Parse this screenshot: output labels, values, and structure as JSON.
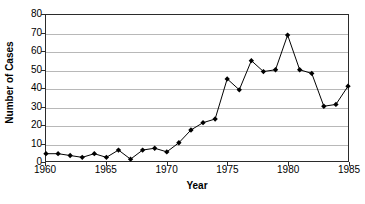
{
  "chart_data": {
    "type": "line",
    "title": "",
    "xlabel": "Year",
    "ylabel": "Number of Cases",
    "xlim": [
      1960,
      1985
    ],
    "ylim": [
      0,
      80
    ],
    "ytick_step": 10,
    "xtick_step": 5,
    "grid": true,
    "grid_axis": "y",
    "legend": false,
    "marker": "diamond",
    "line_color": "#000000",
    "marker_color": "#000000",
    "grid_color": "#b8b8b8",
    "axis_color": "#2b2b2b",
    "x": [
      1960,
      1961,
      1962,
      1963,
      1964,
      1965,
      1966,
      1967,
      1968,
      1969,
      1970,
      1971,
      1972,
      1973,
      1974,
      1975,
      1976,
      1977,
      1978,
      1979,
      1980,
      1981,
      1982,
      1983,
      1984,
      1985
    ],
    "values": [
      4,
      4,
      3,
      2,
      4,
      2,
      6,
      1,
      6,
      7,
      5,
      10,
      17,
      21,
      23,
      45,
      39,
      55,
      49,
      50,
      69,
      50,
      48,
      30,
      31,
      41
    ],
    "xticks": [
      1960,
      1965,
      1970,
      1975,
      1980,
      1985
    ],
    "xtick_labels": [
      "1960",
      "1965",
      "1970",
      "1975",
      "1980",
      "1985"
    ],
    "yticks": [
      0,
      10,
      20,
      30,
      40,
      50,
      60,
      70,
      80
    ],
    "ytick_labels": [
      "0",
      "10",
      "20",
      "30",
      "40",
      "50",
      "60",
      "70",
      "80"
    ]
  }
}
